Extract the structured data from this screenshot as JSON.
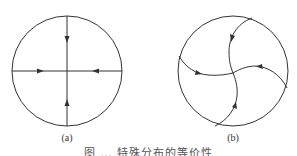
{
  "figure": {
    "panels": [
      {
        "label": "(a)",
        "description": "Circle with four straight flow lines meeting at the center; arrows point inward",
        "circle": {
          "cx": 67,
          "cy": 71,
          "r": 55
        },
        "center": {
          "x": 67,
          "y": 71
        },
        "arrows": [
          "down",
          "right",
          "left",
          "up"
        ]
      },
      {
        "label": "(b)",
        "description": "Circle with four curved flow lines spiraling into the center; arrows point inward",
        "circle": {
          "cx": 233,
          "cy": 71,
          "r": 55
        },
        "center": {
          "x": 233,
          "y": 73
        }
      }
    ],
    "caption": "图 … 特殊分布的等价性"
  },
  "colors": {
    "stroke": "#333333",
    "background": "#ffffff"
  }
}
